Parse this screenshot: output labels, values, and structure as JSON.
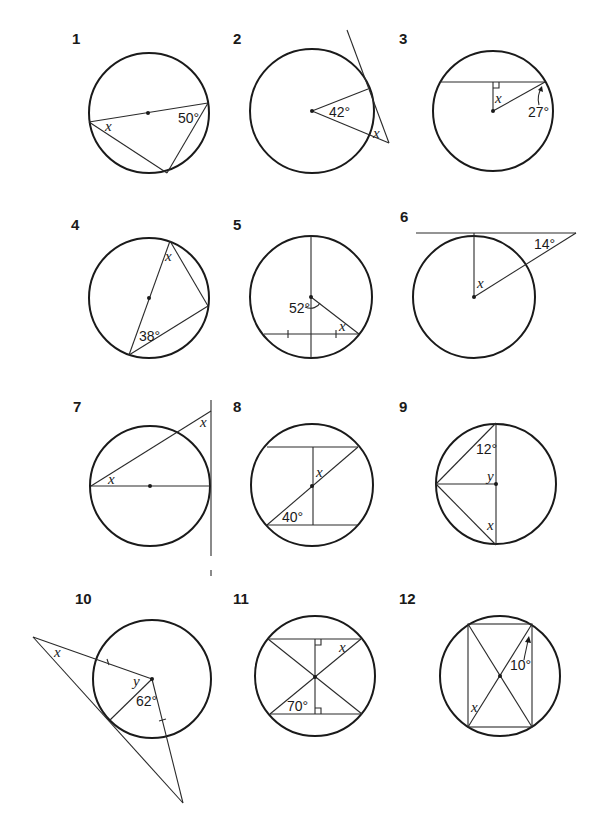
{
  "problems": [
    {
      "number": "1",
      "labels": {
        "unknown": "x",
        "given": "50°"
      }
    },
    {
      "number": "2",
      "labels": {
        "unknown": "x",
        "given": "42°"
      }
    },
    {
      "number": "3",
      "labels": {
        "unknown": "x",
        "given": "27°"
      }
    },
    {
      "number": "4",
      "labels": {
        "unknown": "x",
        "given": "38°"
      }
    },
    {
      "number": "5",
      "labels": {
        "unknown": "x",
        "given": "52°"
      }
    },
    {
      "number": "6",
      "labels": {
        "unknown": "x",
        "given": "14°"
      }
    },
    {
      "number": "7",
      "labels": {
        "unknown": "x",
        "unknown2": "x"
      }
    },
    {
      "number": "8",
      "labels": {
        "unknown": "x",
        "given": "40°"
      }
    },
    {
      "number": "9",
      "labels": {
        "unknown": "x",
        "unknown2": "y",
        "given": "12°"
      }
    },
    {
      "number": "10",
      "labels": {
        "unknown": "x",
        "unknown2": "y",
        "given": "62°"
      }
    },
    {
      "number": "11",
      "labels": {
        "unknown": "x",
        "given": "70°"
      }
    },
    {
      "number": "12",
      "labels": {
        "unknown": "x",
        "given": "10°"
      }
    }
  ],
  "colors": {
    "ink": "#1a1a1a",
    "paper": "#ffffff"
  }
}
